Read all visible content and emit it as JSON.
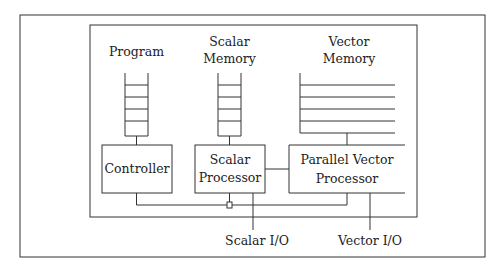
{
  "diagram": {
    "type": "block-diagram",
    "labels": {
      "program": "Program",
      "scalar_memory_line1": "Scalar",
      "scalar_memory_line2": "Memory",
      "vector_memory_line1": "Vector",
      "vector_memory_line2": "Memory",
      "controller": "Controller",
      "scalar_processor_line1": "Scalar",
      "scalar_processor_line2": "Processor",
      "parallel_vector_line1": "Parallel Vector",
      "parallel_vector_line2": "Processor",
      "scalar_io": "Scalar I/O",
      "vector_io": "Vector I/O"
    },
    "colors": {
      "line": "#333333",
      "background": "#ffffff"
    }
  }
}
